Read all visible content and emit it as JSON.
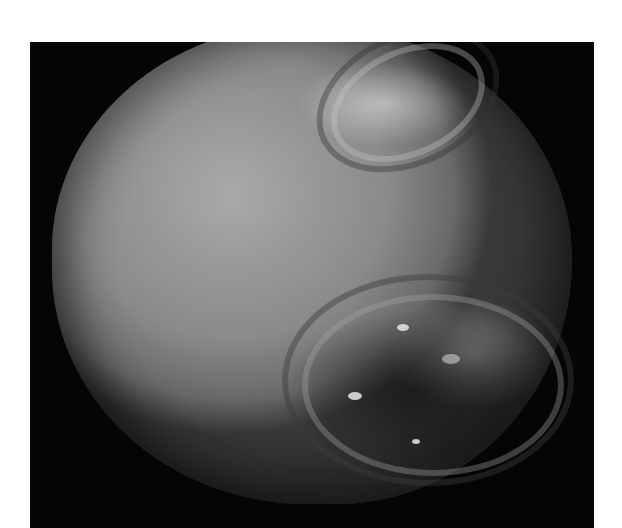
{
  "image": {
    "subject": "grayscale photograph of a rocky moon with grooved terrain",
    "background_color": "#050505",
    "page_color": "#ffffff"
  }
}
